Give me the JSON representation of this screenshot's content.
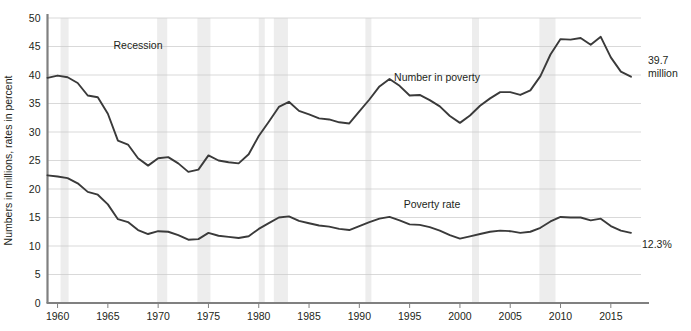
{
  "chart_data": {
    "type": "line",
    "title": "",
    "xlabel": "",
    "ylabel": "Numbers in millions, rates in percent",
    "xlim": [
      1959,
      2018
    ],
    "ylim": [
      0,
      50
    ],
    "grid": true,
    "legend_position": "inline-annotation",
    "x_tick_labels": [
      "1960",
      "1965",
      "1970",
      "1975",
      "1980",
      "1985",
      "1990",
      "1995",
      "2000",
      "2005",
      "2010",
      "2015"
    ],
    "x_ticks": [
      1960,
      1965,
      1970,
      1975,
      1980,
      1985,
      1990,
      1995,
      2000,
      2005,
      2010,
      2015
    ],
    "y_tick_labels": [
      "0",
      "5",
      "10",
      "15",
      "20",
      "25",
      "30",
      "35",
      "40",
      "45",
      "50"
    ],
    "y_ticks": [
      0,
      5,
      10,
      15,
      20,
      25,
      30,
      35,
      40,
      45,
      50
    ],
    "x": [
      1959,
      1960,
      1961,
      1962,
      1963,
      1964,
      1965,
      1966,
      1967,
      1968,
      1969,
      1970,
      1971,
      1972,
      1973,
      1974,
      1975,
      1976,
      1977,
      1978,
      1979,
      1980,
      1981,
      1982,
      1983,
      1984,
      1985,
      1986,
      1987,
      1988,
      1989,
      1990,
      1991,
      1992,
      1993,
      1994,
      1995,
      1996,
      1997,
      1998,
      1999,
      2000,
      2001,
      2002,
      2003,
      2004,
      2005,
      2006,
      2007,
      2008,
      2009,
      2010,
      2011,
      2012,
      2013,
      2014,
      2015,
      2016,
      2017
    ],
    "series": [
      {
        "name": "Number in poverty",
        "unit": "millions",
        "label_text": "Number in poverty",
        "end_annotation": "39.7\nmillion",
        "values": [
          39.5,
          39.9,
          39.6,
          38.6,
          36.4,
          36.1,
          33.2,
          28.5,
          27.8,
          25.4,
          24.1,
          25.4,
          25.6,
          24.5,
          23.0,
          23.4,
          25.9,
          25.0,
          24.7,
          24.5,
          26.1,
          29.3,
          31.8,
          34.4,
          35.3,
          33.7,
          33.1,
          32.4,
          32.2,
          31.7,
          31.5,
          33.6,
          35.7,
          38.0,
          39.3,
          38.1,
          36.4,
          36.5,
          35.6,
          34.5,
          32.8,
          31.6,
          32.9,
          34.6,
          35.9,
          37.0,
          37.0,
          36.5,
          37.3,
          39.8,
          43.6,
          46.3,
          46.2,
          46.5,
          45.3,
          46.7,
          43.1,
          40.6,
          39.7
        ]
      },
      {
        "name": "Poverty rate",
        "unit": "percent",
        "label_text": "Poverty rate",
        "end_annotation": "12.3%",
        "values": [
          22.4,
          22.2,
          21.9,
          21.0,
          19.5,
          19.0,
          17.3,
          14.7,
          14.2,
          12.8,
          12.1,
          12.6,
          12.5,
          11.9,
          11.1,
          11.2,
          12.3,
          11.8,
          11.6,
          11.4,
          11.7,
          13.0,
          14.0,
          15.0,
          15.2,
          14.4,
          14.0,
          13.6,
          13.4,
          13.0,
          12.8,
          13.5,
          14.2,
          14.8,
          15.1,
          14.5,
          13.8,
          13.7,
          13.3,
          12.7,
          11.9,
          11.3,
          11.7,
          12.1,
          12.5,
          12.7,
          12.6,
          12.3,
          12.5,
          13.2,
          14.3,
          15.1,
          15.0,
          15.0,
          14.5,
          14.8,
          13.5,
          12.7,
          12.3
        ]
      }
    ],
    "recession_label": "Recession",
    "recession_bands": [
      {
        "start": 1960.3,
        "end": 1961.1
      },
      {
        "start": 1969.9,
        "end": 1970.9
      },
      {
        "start": 1973.9,
        "end": 1975.2
      },
      {
        "start": 1980.0,
        "end": 1980.6
      },
      {
        "start": 1981.5,
        "end": 1982.9
      },
      {
        "start": 1990.6,
        "end": 1991.2
      },
      {
        "start": 2001.2,
        "end": 2001.9
      },
      {
        "start": 2007.9,
        "end": 2009.5
      }
    ],
    "colors": {
      "line": "#3a3a3a",
      "gridline": "#c9c9c9",
      "axis": "#808080",
      "recession_band": "#ededed",
      "text": "#231f20",
      "background": "#ffffff"
    }
  }
}
